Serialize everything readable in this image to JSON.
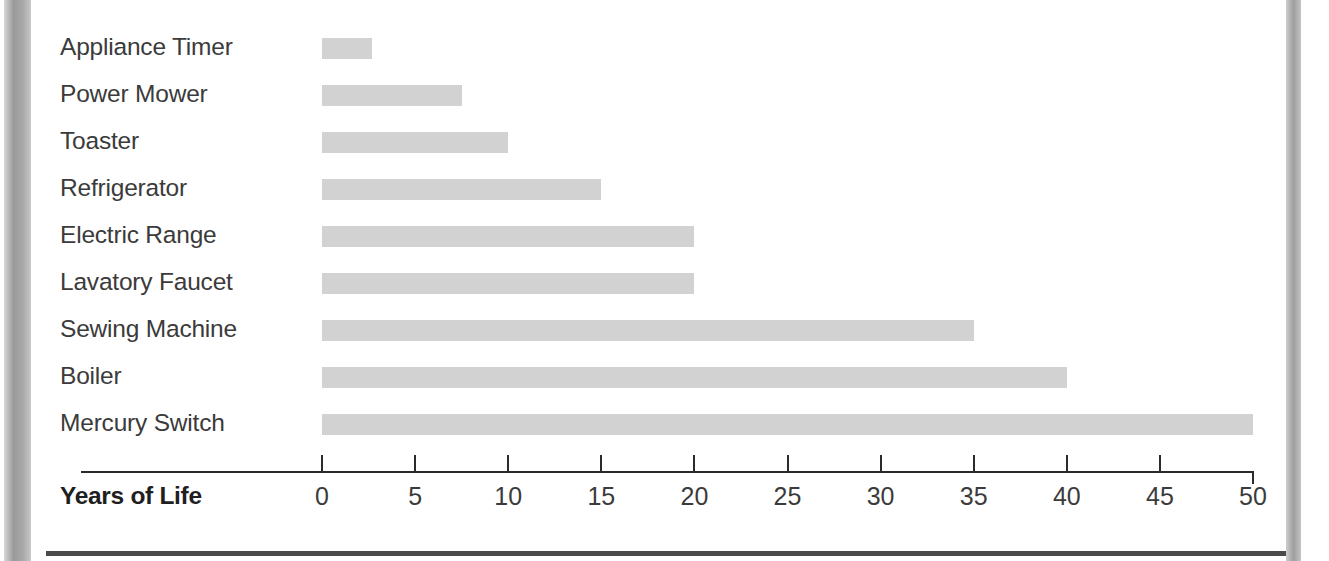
{
  "chart_data": {
    "type": "bar",
    "orientation": "horizontal",
    "title": "",
    "subtitle": "",
    "xlabel": "Years of Life",
    "ylabel": "",
    "categories": [
      "Appliance Timer",
      "Power Mower",
      "Toaster",
      "Refrigerator",
      "Electric Range",
      "Lavatory Faucet",
      "Sewing Machine",
      "Boiler",
      "Mercury Switch"
    ],
    "values": [
      2.7,
      7.5,
      10,
      15,
      20,
      20,
      35,
      40,
      50
    ],
    "xlim": [
      0,
      50
    ],
    "xticks": [
      0,
      5,
      10,
      15,
      20,
      25,
      30,
      35,
      40,
      45,
      50
    ],
    "xtick_labels": [
      "0",
      "5",
      "10",
      "15",
      "20",
      "25",
      "30",
      "35",
      "40",
      "45",
      "50"
    ],
    "grid": false,
    "legend": null,
    "bar_color": "#d2d2d2",
    "axis_color": "#2b2b2b",
    "label_color": "#3b3b3b"
  }
}
